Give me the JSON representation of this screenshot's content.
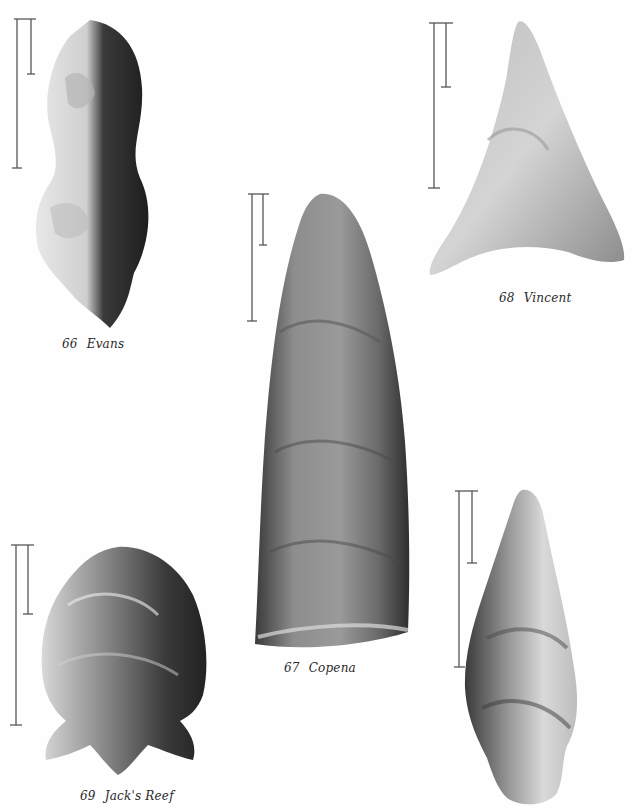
{
  "plate": {
    "figures": [
      {
        "number": "66",
        "name": "Evans"
      },
      {
        "number": "67",
        "name": "Copena"
      },
      {
        "number": "68",
        "name": "Vincent"
      },
      {
        "number": "69",
        "name": "Jack's Reef"
      },
      {
        "number": "",
        "name": ""
      }
    ],
    "scale_bars": [
      {
        "figure": "66",
        "long_px": 150,
        "short_px": 55
      },
      {
        "figure": "67",
        "long_px": 128,
        "short_px": 52
      },
      {
        "figure": "68",
        "long_px": 166,
        "short_px": 64
      },
      {
        "figure": "69",
        "long_px": 180,
        "short_px": 70
      },
      {
        "figure": "unlabeled",
        "long_px": 176,
        "short_px": 72
      }
    ],
    "colors": {
      "background": "#fefefe",
      "scale_bar": "#555555",
      "caption": "#2a2a2a",
      "stone_dark": "#2b2b2b",
      "stone_mid": "#8a8a8a",
      "stone_light": "#d9d9d9"
    }
  }
}
